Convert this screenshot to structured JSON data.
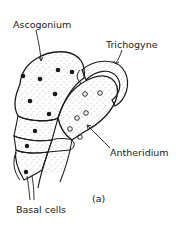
{
  "figure": {
    "subfigure_label": "(a)",
    "labels": {
      "ascogonium": "Ascogonium",
      "trichogyne": "Trichogyne",
      "antheridium": "Antheridium",
      "basal_cells": "Basal cells"
    },
    "colors": {
      "ink": "#1a1a1a",
      "stipple": "#6b6b6b",
      "background": "#ffffff"
    },
    "ascogonium_nuclei_count": 8,
    "antheridium_nuclei_count": 6,
    "basal_cell_nuclei_count": 3
  }
}
